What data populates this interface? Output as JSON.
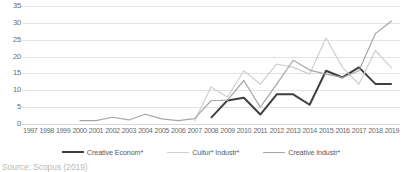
{
  "caption": "Source: Scopus (2019)",
  "axes": {
    "yticks": [
      "35",
      "30",
      "25",
      "20",
      "15",
      "10",
      "5",
      "0"
    ],
    "xticks": [
      "1997",
      "1998",
      "1999",
      "2000",
      "2001",
      "2002",
      "2003",
      "2004",
      "2005",
      "2006",
      "2007",
      "2008",
      "2009",
      "2010",
      "2011",
      "2012",
      "2013",
      "2014",
      "2015",
      "2016",
      "2017",
      "2018",
      "2019"
    ]
  },
  "legend": {
    "items": [
      {
        "label": "Creative Econom*",
        "color": "#3f3f3f",
        "width": "2.2px"
      },
      {
        "label": "Cultur* Industr*",
        "color": "#cfcfcf",
        "width": "1.3px"
      },
      {
        "label": "Creative Industr*",
        "color": "#a6a6a6",
        "width": "1.3px"
      }
    ]
  },
  "chart_data": {
    "type": "line",
    "title": "",
    "xlabel": "",
    "ylabel": "",
    "ylim": [
      0,
      35
    ],
    "ytick_step": 5,
    "grid": true,
    "legend_position": "bottom",
    "x": [
      "1997",
      "1998",
      "1999",
      "2000",
      "2001",
      "2002",
      "2003",
      "2004",
      "2005",
      "2006",
      "2007",
      "2008",
      "2009",
      "2010",
      "2011",
      "2012",
      "2013",
      "2014",
      "2015",
      "2016",
      "2017",
      "2018",
      "2019"
    ],
    "series": [
      {
        "name": "Creative Econom*",
        "color": "#3f3f3f",
        "values": [
          null,
          null,
          null,
          null,
          null,
          null,
          null,
          null,
          null,
          null,
          null,
          1.8,
          7.0,
          7.8,
          2.8,
          8.8,
          8.8,
          5.7,
          15.8,
          13.8,
          16.8,
          11.9,
          11.9
        ]
      },
      {
        "name": "Cultur* Industr*",
        "color": "#cfcfcf",
        "values": [
          null,
          null,
          null,
          null,
          null,
          null,
          null,
          null,
          null,
          null,
          0.8,
          11.0,
          8.0,
          15.8,
          11.8,
          17.8,
          16.8,
          14.8,
          25.5,
          16.8,
          11.8,
          21.8,
          16.5
        ]
      },
      {
        "name": "Creative Industr*",
        "color": "#a6a6a6",
        "values": [
          null,
          null,
          null,
          1.0,
          1.0,
          2.0,
          1.2,
          2.9,
          1.5,
          1.0,
          1.6,
          6.9,
          7.1,
          12.9,
          5.0,
          11.8,
          18.9,
          16.0,
          14.8,
          13.8,
          15.8,
          26.8,
          30.6
        ]
      }
    ]
  }
}
